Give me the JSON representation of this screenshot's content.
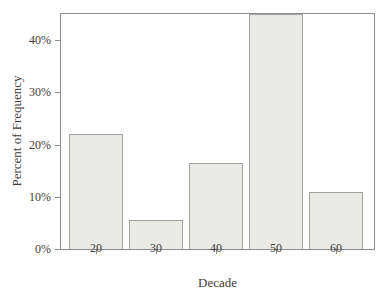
{
  "chart_data": {
    "type": "bar",
    "title": "",
    "categories": [
      "20",
      "30",
      "40",
      "50",
      "60"
    ],
    "values": [
      22,
      5.5,
      16.5,
      45,
      11
    ],
    "xlabel": "Decade",
    "ylabel": "Percent of Frequency",
    "ylim": [
      0,
      45
    ],
    "yticks": [
      {
        "value": 0,
        "label": "0%"
      },
      {
        "value": 10,
        "label": "10%"
      },
      {
        "value": 20,
        "label": "20%"
      },
      {
        "value": 30,
        "label": "30%"
      },
      {
        "value": 40,
        "label": "40%"
      }
    ],
    "grid": false,
    "legend": "none",
    "frame": true,
    "colors": {
      "bar_fill": "#e9e9e6",
      "bar_border": "#a3a39e",
      "frame": "#8d8d8d",
      "text": "#3f3b38",
      "background": "#ffffff"
    }
  }
}
